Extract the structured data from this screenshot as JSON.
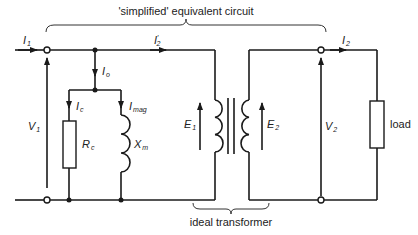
{
  "title": "'simplified' equivalent circuit",
  "bottom_label": "ideal transformer",
  "load_label": "load",
  "labels": {
    "I1": {
      "main": "I",
      "sub": "1"
    },
    "I2prime": {
      "main": "I",
      "prime": "′",
      "sub": "2"
    },
    "I2": {
      "main": "I",
      "sub": "2"
    },
    "Io": {
      "main": "I",
      "sub": "o"
    },
    "Ic": {
      "main": "I",
      "sub": "c"
    },
    "Imag": {
      "main": "I",
      "sub": "mag"
    },
    "V1": {
      "main": "V",
      "sub": "1"
    },
    "V2": {
      "main": "V",
      "sub": "2"
    },
    "Rc": {
      "main": "R",
      "sub": "c"
    },
    "Xm": {
      "main": "X",
      "sub": "m"
    },
    "E1": {
      "main": "E",
      "sub": "1"
    },
    "E2": {
      "main": "E",
      "sub": "2"
    }
  },
  "colors": {
    "line": "#1a1a1a",
    "background": "#ffffff"
  }
}
